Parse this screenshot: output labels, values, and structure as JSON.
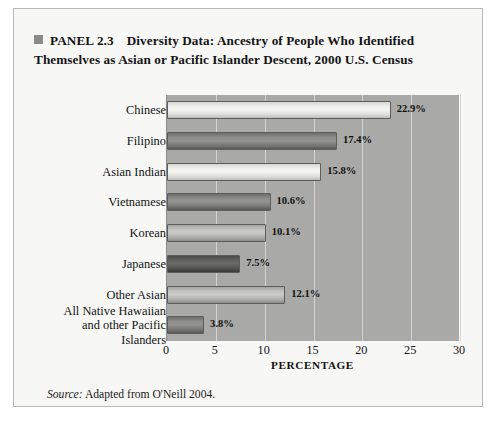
{
  "panel": {
    "marker_icon": "panel-square-icon",
    "tag": "PANEL 2.3",
    "title_line1": "Diversity Data: Ancestry of People Who Identified",
    "title_line2": "Themselves as Asian or Pacific Islander Descent, 2000 U.S. Census"
  },
  "source": {
    "label": "Source:",
    "text": " Adapted from O'Neill 2004."
  },
  "chart_data": {
    "type": "bar",
    "orientation": "horizontal",
    "title": "Diversity Data: Ancestry of People Who Identified Themselves as Asian or Pacific Islander Descent, 2000 U.S. Census",
    "xlabel": "PERCENTAGE",
    "ylabel": "",
    "xlim": [
      0,
      30
    ],
    "xticks": [
      0,
      5,
      10,
      15,
      20,
      25,
      30
    ],
    "grid": true,
    "legend": "none",
    "categories": [
      "Chinese",
      "Filipino",
      "Asian Indian",
      "Vietnamese",
      "Korean",
      "Japanese",
      "Other Asian",
      "All Native Hawaiian and other Pacific Islanders"
    ],
    "values": [
      22.9,
      17.4,
      15.8,
      10.6,
      10.1,
      7.5,
      12.1,
      3.8
    ],
    "value_labels": [
      "22.9%",
      "17.4%",
      "15.8%",
      "10.6%",
      "10.1%",
      "7.5%",
      "12.1%",
      "3.8%"
    ],
    "bar_shades": [
      "light",
      "dark",
      "light",
      "dark",
      "mid",
      "darkest",
      "mid",
      "dark"
    ],
    "plot_background": "#a9a9a7",
    "gridline_color": "#d3d3d1"
  },
  "category_lines": [
    [
      "Chinese"
    ],
    [
      "Filipino"
    ],
    [
      "Asian Indian"
    ],
    [
      "Vietnamese"
    ],
    [
      "Korean"
    ],
    [
      "Japanese"
    ],
    [
      "Other Asian"
    ],
    [
      "All Native Hawaiian",
      "and other Pacific",
      "Islanders"
    ]
  ]
}
